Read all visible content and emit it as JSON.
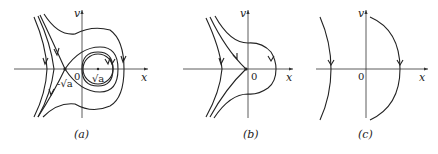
{
  "figure": {
    "panels": [
      {
        "id": "a",
        "caption": "(a)",
        "x_axis_label": "x",
        "y_axis_label": "v",
        "origin_label": "0",
        "points": [
          {
            "label": "-√a",
            "role": "saddle point"
          },
          {
            "label": "√a",
            "role": "center"
          }
        ]
      },
      {
        "id": "b",
        "caption": "(b)",
        "x_axis_label": "x",
        "y_axis_label": "v",
        "origin_label": "0"
      },
      {
        "id": "c",
        "caption": "(c)",
        "x_axis_label": "x",
        "y_axis_label": "v",
        "origin_label": "0"
      }
    ]
  }
}
